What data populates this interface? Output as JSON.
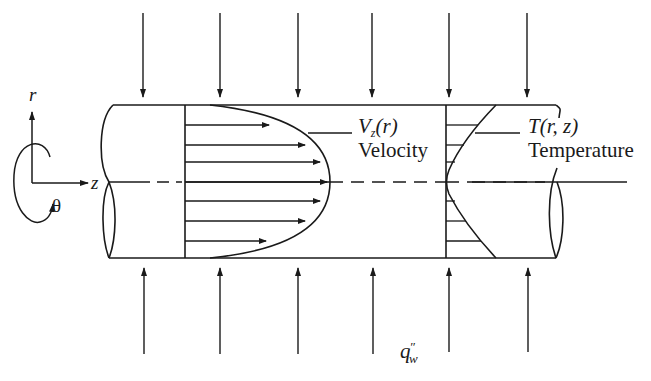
{
  "diagram": {
    "type": "pipe-flow-heat-transfer",
    "colors": {
      "ink": "#1a1a1a",
      "background": "#ffffff"
    },
    "coordinates": {
      "r_label": "r",
      "z_label": "z",
      "theta_label": "θ"
    },
    "velocity": {
      "symbol": "V",
      "subscript": "z",
      "arg": "(r)",
      "label": "Velocity",
      "profile": "parabolic"
    },
    "temperature": {
      "symbol": "T",
      "arg": "(r, z)",
      "label": "Temperature"
    },
    "heat_flux": {
      "symbol": "q",
      "superscript": "″",
      "subscript": "w",
      "arrow_count_top": 6,
      "arrow_count_bottom": 6
    }
  }
}
